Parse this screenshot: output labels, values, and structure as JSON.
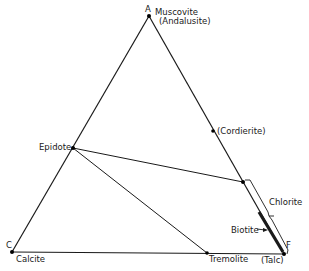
{
  "diagram": {
    "type": "ternary-phase-diagram",
    "vertices": {
      "A": {
        "letter": "A",
        "mineral": "Muscovite",
        "alt": "(Andalusite)"
      },
      "C": {
        "letter": "C",
        "mineral": "Calcite"
      },
      "F": {
        "letter": "F",
        "alt": "(Talc)"
      }
    },
    "points": {
      "epidote": "Epidote",
      "cordierite": "(Cordierite)",
      "tremolite": "Tremolite"
    },
    "ranges": {
      "chlorite": "Chlorite",
      "biotite": "Biotite"
    },
    "colors": {
      "line": "#1a1a1a",
      "background": "#ffffff"
    }
  }
}
